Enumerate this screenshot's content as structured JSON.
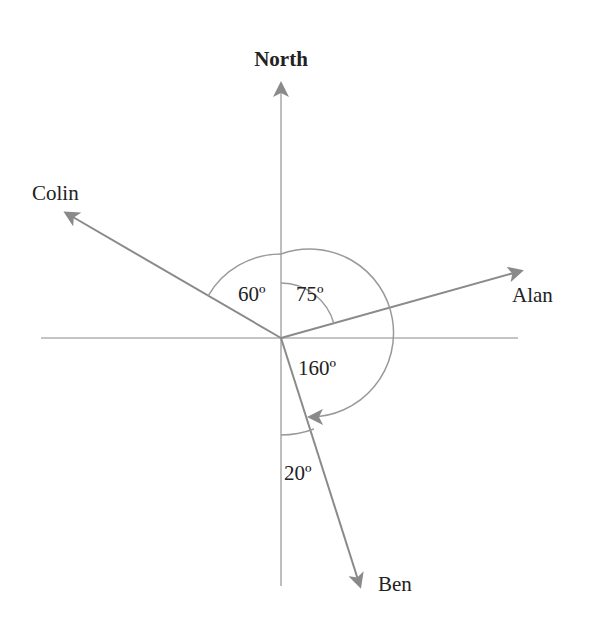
{
  "diagram": {
    "title": "North",
    "colors": {
      "axis": "#a8a8a8",
      "arrow": "#8a8a8a",
      "arc": "#9a9a9a",
      "text": "#222222"
    },
    "origin": [
      281,
      338
    ],
    "people": [
      {
        "name": "Colin",
        "bearing_deg": 300,
        "label": "Colin"
      },
      {
        "name": "Alan",
        "bearing_deg": 75,
        "label": "Alan"
      },
      {
        "name": "Ben",
        "bearing_deg": 160,
        "label": "Ben"
      }
    ],
    "angles": [
      {
        "label": "60º",
        "between": [
          "Colin",
          "North"
        ]
      },
      {
        "label": "75º",
        "between": [
          "North",
          "Alan"
        ]
      },
      {
        "label": "160º",
        "between": [
          "North",
          "Ben"
        ],
        "arrow": true
      },
      {
        "label": "20º",
        "between": [
          "South",
          "Ben"
        ]
      }
    ]
  }
}
